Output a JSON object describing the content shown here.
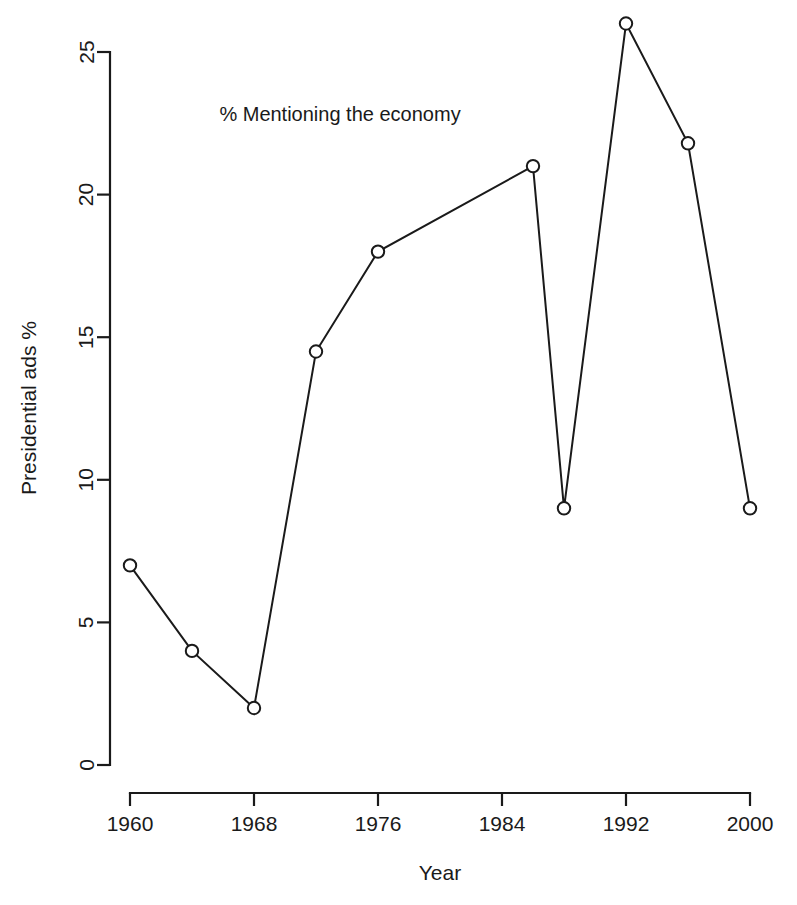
{
  "chart_data": {
    "type": "line",
    "title": "% Mentioning the economy",
    "xlabel": "Year",
    "ylabel": "Presidential ads %",
    "xlim": [
      1958,
      2002
    ],
    "ylim": [
      0,
      26.5
    ],
    "grid": false,
    "legend": "none",
    "x_ticks": [
      1960,
      1968,
      1976,
      1984,
      1992,
      2000
    ],
    "x_tick_labels": [
      "1960",
      "1968",
      "1976",
      "1984",
      "1992",
      "2000"
    ],
    "y_ticks": [
      0,
      5,
      10,
      15,
      20,
      25
    ],
    "y_tick_labels": [
      "0",
      "5",
      "10",
      "15",
      "20",
      "25"
    ],
    "marker": "open-circle",
    "series": [
      {
        "name": "% Mentioning the economy",
        "x": [
          1960,
          1964,
          1968,
          1972,
          1976,
          1986,
          1988,
          1992,
          1996,
          2000
        ],
        "values": [
          7.0,
          4.0,
          2.0,
          14.5,
          18.0,
          21.0,
          9.0,
          26.0,
          21.8,
          9.0
        ]
      }
    ]
  }
}
